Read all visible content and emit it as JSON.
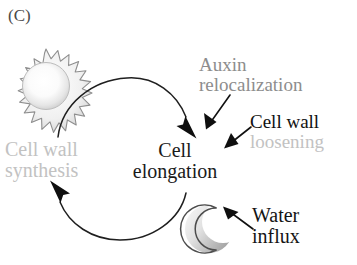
{
  "figure": {
    "panel_label": "(C)",
    "background_color": "#ffffff"
  },
  "center": {
    "line1": "Cell",
    "line2": "elongation",
    "color": "#1a1a1a"
  },
  "labels": {
    "cell_wall_synthesis": {
      "line1": "Cell wall",
      "line2": "synthesis",
      "color": "#c2c2c2"
    },
    "auxin_relocalization": {
      "line1": "Auxin",
      "line2": "relocalization",
      "color": "#8d8d8d"
    },
    "cell_wall_loosening": {
      "line1": "Cell wall",
      "line2": "loosening",
      "line1_color": "#111111",
      "line2_color": "#c2c2c2"
    },
    "water_influx": {
      "line1": "Water",
      "line2": "influx",
      "color": "#141414"
    }
  },
  "icons": {
    "sun": {
      "name": "sun-icon",
      "spikes": 16,
      "center_x": 46,
      "center_y": 85,
      "outer_radius": 36,
      "inner_radius": 25,
      "core_radius": 22,
      "stroke_color": "#8a8a8a",
      "fill_center_color": "#ffffff",
      "fill_edge_color": "#d0d0d0"
    },
    "moon": {
      "name": "moon-icon",
      "center_x": 209,
      "center_y": 229,
      "radius": 24,
      "stroke_color": "#555555",
      "fill_light_color": "#f2f2f2",
      "fill_dark_color": "#a8a8a8"
    }
  },
  "arrows": {
    "cycle_top": {
      "name": "cycle-arrow-synthesis-to-elongation",
      "stroke_color": "#1f1f1f",
      "from": "Cell wall synthesis",
      "to": "Cell elongation"
    },
    "cycle_bottom": {
      "name": "cycle-arrow-elongation-to-synthesis",
      "stroke_color": "#1f1f1f",
      "from": "Cell elongation",
      "to": "Cell wall synthesis"
    },
    "auxin": {
      "name": "arrow-auxin-to-elongation",
      "stroke_color": "#111111"
    },
    "loosening": {
      "name": "arrow-loosening-to-elongation",
      "stroke_color": "#111111"
    },
    "water": {
      "name": "arrow-water-to-elongation",
      "stroke_color": "#111111"
    }
  }
}
